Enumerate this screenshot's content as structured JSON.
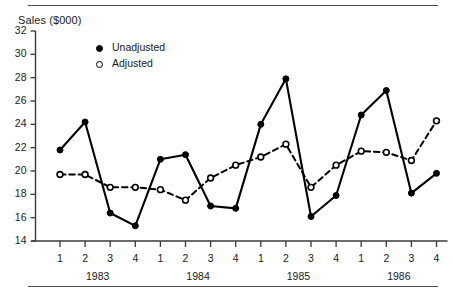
{
  "figure": {
    "axis_title": "Sales ($000)",
    "legend": [
      {
        "label": "Unadjusted",
        "marker": "filled-circle-icon"
      },
      {
        "label": "Adjusted",
        "marker": "hollow-circle-icon"
      }
    ]
  },
  "chart_data": {
    "type": "line",
    "title": "",
    "subtitle": "",
    "xlabel": "",
    "ylabel": "Sales ($000)",
    "ylim": [
      14,
      32
    ],
    "yticks": [
      14,
      16,
      18,
      20,
      22,
      24,
      26,
      28,
      30,
      32
    ],
    "ytick_labels": [
      "14",
      "16",
      "18",
      "20",
      "22",
      "24",
      "26",
      "28",
      "30",
      "32"
    ],
    "grid": false,
    "legend_position": "inside-top-left",
    "x": [
      "1983 Q1",
      "1983 Q2",
      "1983 Q3",
      "1983 Q4",
      "1984 Q1",
      "1984 Q2",
      "1984 Q3",
      "1984 Q4",
      "1985 Q1",
      "1985 Q2",
      "1985 Q3",
      "1985 Q4",
      "1986 Q1",
      "1986 Q2",
      "1986 Q3",
      "1986 Q4"
    ],
    "xtick_labels": [
      "1",
      "2",
      "3",
      "4",
      "1",
      "2",
      "3",
      "4",
      "1",
      "2",
      "3",
      "4",
      "1",
      "2",
      "3",
      "4"
    ],
    "group_labels": [
      "1983",
      "1984",
      "1985",
      "1986"
    ],
    "series": [
      {
        "name": "Unadjusted",
        "marker": "filled-circle",
        "linestyle": "solid",
        "color": "#000000",
        "values": [
          21.8,
          24.2,
          16.4,
          15.3,
          21.0,
          21.4,
          17.0,
          16.8,
          24.0,
          27.9,
          16.1,
          17.9,
          24.8,
          26.9,
          18.1,
          19.8
        ]
      },
      {
        "name": "Adjusted",
        "marker": "hollow-circle",
        "linestyle": "dashed",
        "color": "#000000",
        "values": [
          19.7,
          19.7,
          18.6,
          18.6,
          18.4,
          17.5,
          19.4,
          20.5,
          21.2,
          22.3,
          18.6,
          20.5,
          21.7,
          21.6,
          20.9,
          24.3
        ]
      }
    ]
  }
}
